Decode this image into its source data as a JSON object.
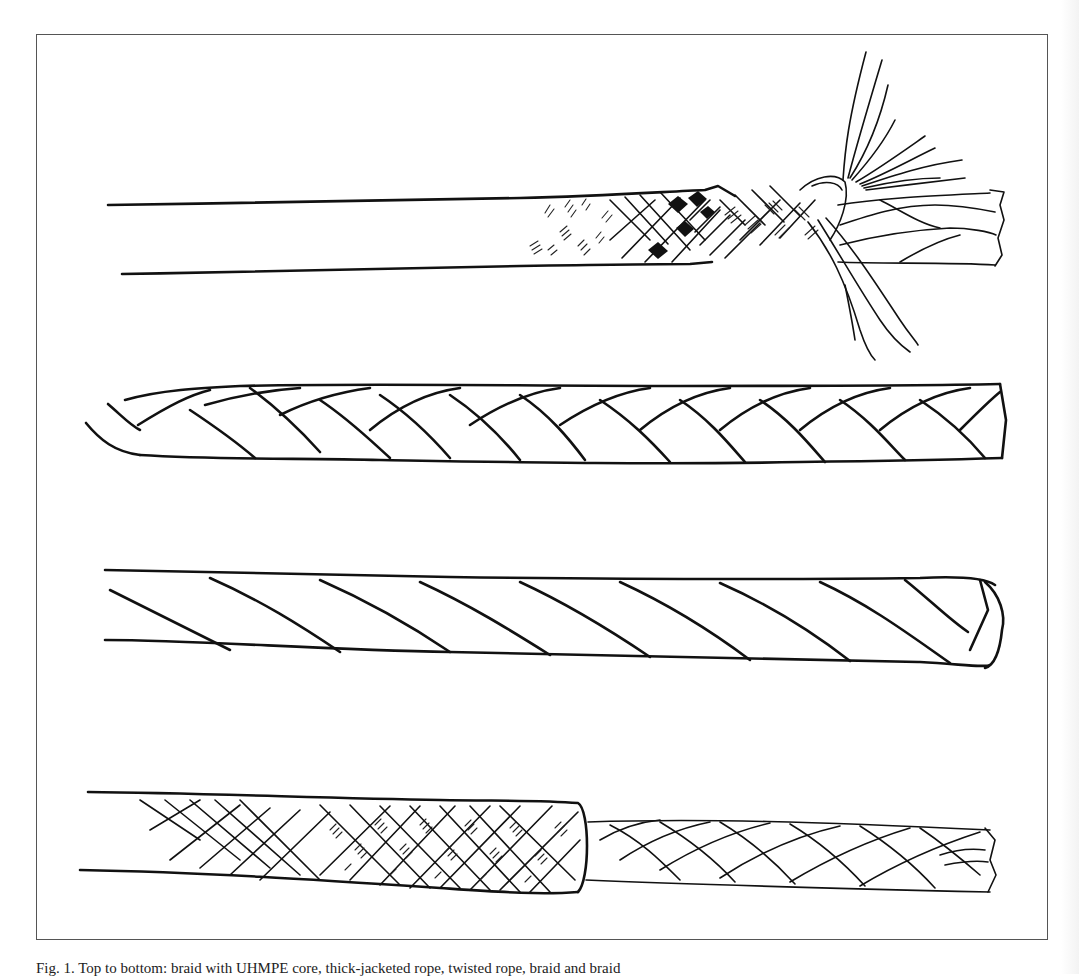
{
  "figure": {
    "caption": "Fig. 1.  Top to bottom: braid with UHMPE core, thick-jacketed rope, twisted rope, braid and braid",
    "frame_border_color": "#555555",
    "ink_color": "#111111",
    "background": "#ffffff",
    "illustrations": [
      {
        "name": "braid-with-core-rope",
        "description": "Jacketed rope with frayed end showing braided cover and splayed core strands"
      },
      {
        "name": "braided-rope",
        "description": "Eight-strand plaited rope"
      },
      {
        "name": "twisted-rope",
        "description": "Three-strand twisted (laid) rope"
      },
      {
        "name": "braid-on-braid-rope",
        "description": "Braid-on-braid rope with jacket pulled back exposing inner braid"
      }
    ]
  }
}
